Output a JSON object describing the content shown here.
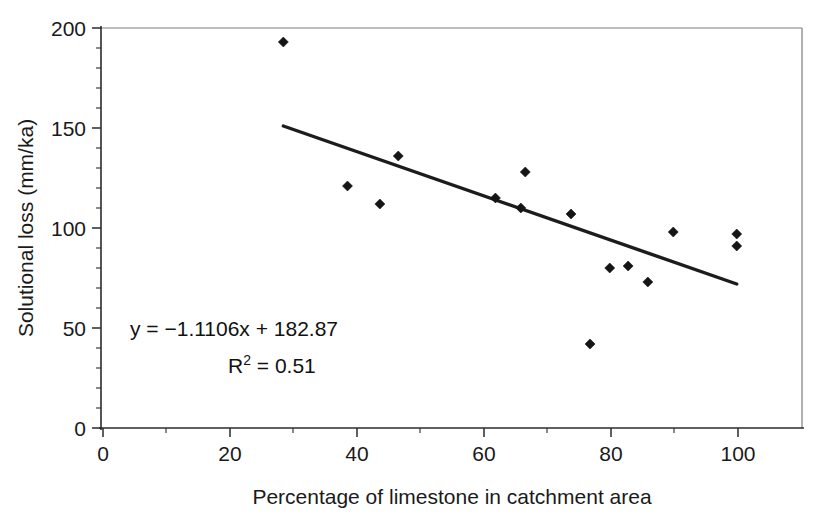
{
  "figure": {
    "background": "#ffffff",
    "ink_color": "#1a1a1a"
  },
  "chart_data": {
    "type": "scatter",
    "title": "",
    "xlabel": "Percentage of limestone in catchment area",
    "ylabel": "Solutional loss (mm/ka)",
    "xlim": [
      0,
      110
    ],
    "ylim": [
      0,
      200
    ],
    "xticks": [
      0,
      20,
      40,
      60,
      80,
      100
    ],
    "xtick_labels": [
      "0",
      "20",
      "40",
      "60",
      "80",
      "100"
    ],
    "xticks_minor": [
      10,
      30,
      50,
      70,
      90
    ],
    "yticks": [
      0,
      50,
      100,
      150,
      200
    ],
    "ytick_labels": [
      "0",
      "50",
      "100",
      "150",
      "200"
    ],
    "yticks_minor": [
      10,
      20,
      30,
      40,
      60,
      70,
      80,
      90,
      110,
      120,
      130,
      140,
      160,
      170,
      180,
      190
    ],
    "grid": false,
    "legend": null,
    "points": [
      {
        "x": 28.4,
        "y": 193
      },
      {
        "x": 38.5,
        "y": 121
      },
      {
        "x": 43.6,
        "y": 112
      },
      {
        "x": 46.5,
        "y": 136
      },
      {
        "x": 61.8,
        "y": 115
      },
      {
        "x": 65.8,
        "y": 110
      },
      {
        "x": 66.5,
        "y": 128
      },
      {
        "x": 73.7,
        "y": 107
      },
      {
        "x": 76.7,
        "y": 42
      },
      {
        "x": 79.8,
        "y": 80
      },
      {
        "x": 82.7,
        "y": 81
      },
      {
        "x": 85.8,
        "y": 73
      },
      {
        "x": 89.8,
        "y": 98
      },
      {
        "x": 99.8,
        "y": 97
      },
      {
        "x": 99.8,
        "y": 91
      }
    ],
    "trendline": {
      "slope": -1.1106,
      "intercept": 182.87,
      "r_squared": 0.51,
      "x_start": 28.4,
      "x_end": 99.8,
      "y_start": 151,
      "y_end": 72
    },
    "annotations": {
      "equation": "y = −1.1106x + 182.87",
      "r2_prefix": "R",
      "r2_exponent": "2",
      "r2_value": " = 0.51"
    }
  }
}
